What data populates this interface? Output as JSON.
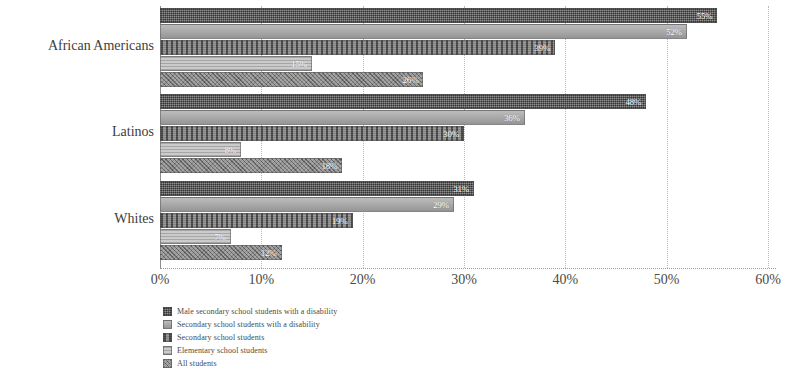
{
  "chart_data": {
    "type": "bar",
    "orientation": "horizontal",
    "title": "",
    "xlabel": "",
    "ylabel": "",
    "xlim": [
      0,
      60
    ],
    "xtick_labels": [
      "0%",
      "10%",
      "20%",
      "30%",
      "40%",
      "50%",
      "60%"
    ],
    "xticks": [
      0,
      10,
      20,
      30,
      40,
      50,
      60
    ],
    "grid": true,
    "legend_position": "bottom-left",
    "categories": [
      "African Americans",
      "Latinos",
      "Whites"
    ],
    "series": [
      {
        "name": "Male secondary school students with a disability",
        "values": [
          55,
          48,
          31
        ],
        "value_labels": [
          "55%",
          "48%",
          "31%"
        ],
        "color": "#6e6e6e"
      },
      {
        "name": "Secondary school students with a disability",
        "values": [
          52,
          36,
          29
        ],
        "value_labels": [
          "52%",
          "36%",
          "29%"
        ],
        "color": "#a6a6a6"
      },
      {
        "name": "Secondary school students",
        "values": [
          39,
          30,
          19
        ],
        "value_labels": [
          "39%",
          "30%",
          "19%"
        ],
        "color": "#777777"
      },
      {
        "name": "Elementary school students",
        "values": [
          15,
          8,
          7
        ],
        "value_labels": [
          "15%",
          "8%",
          "7%"
        ],
        "color": "#bdbdbd"
      },
      {
        "name": "All students",
        "values": [
          26,
          18,
          12
        ],
        "value_labels": [
          "26%",
          "18%",
          "12%"
        ],
        "color": "#8a8a8a"
      }
    ]
  }
}
